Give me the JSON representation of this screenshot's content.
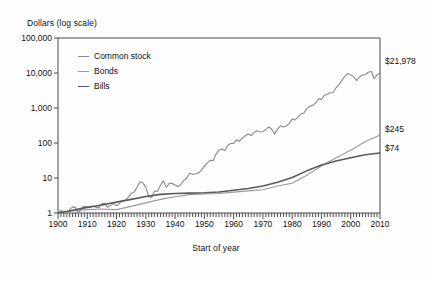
{
  "chart_data": {
    "type": "line",
    "title": "",
    "ylabel": "Dollars (log scale)",
    "xlabel": "Start of year",
    "scale": "log",
    "grid": false,
    "legend_position": "top-left",
    "xlim": [
      1900,
      2010
    ],
    "ylim": [
      1,
      100000
    ],
    "ytick_labels": [
      "100,000",
      "10,000",
      "1,000",
      "100",
      "10",
      "1"
    ],
    "ytick_values": [
      100000,
      10000,
      1000,
      100,
      10,
      1
    ],
    "xtick_labels": [
      "1900",
      "1910",
      "1920",
      "1930",
      "1940",
      "1950",
      "1960",
      "1970",
      "1980",
      "1990",
      "2000",
      "2010"
    ],
    "xtick_values": [
      1900,
      1910,
      1920,
      1930,
      1940,
      1950,
      1960,
      1970,
      1980,
      1990,
      2000,
      2010
    ],
    "minor_tick_interval": 1,
    "end_labels": [
      {
        "series": "Common stock",
        "text": "$21,978",
        "value": 21978
      },
      {
        "series": "Bonds",
        "text": "$245",
        "value": 245
      },
      {
        "series": "Bills",
        "text": "$74",
        "value": 74
      }
    ],
    "series": [
      {
        "name": "Common stock",
        "color": "#8a8a8a",
        "x": [
          1900,
          1901,
          1902,
          1903,
          1904,
          1905,
          1906,
          1907,
          1908,
          1909,
          1910,
          1911,
          1912,
          1913,
          1914,
          1915,
          1916,
          1917,
          1918,
          1919,
          1920,
          1921,
          1922,
          1923,
          1924,
          1925,
          1926,
          1927,
          1928,
          1929,
          1930,
          1931,
          1932,
          1933,
          1934,
          1935,
          1936,
          1937,
          1938,
          1939,
          1940,
          1941,
          1942,
          1943,
          1944,
          1945,
          1946,
          1947,
          1948,
          1949,
          1950,
          1951,
          1952,
          1953,
          1954,
          1955,
          1956,
          1957,
          1958,
          1959,
          1960,
          1961,
          1962,
          1963,
          1964,
          1965,
          1966,
          1967,
          1968,
          1969,
          1970,
          1971,
          1972,
          1973,
          1974,
          1975,
          1976,
          1977,
          1978,
          1979,
          1980,
          1981,
          1982,
          1983,
          1984,
          1985,
          1986,
          1987,
          1988,
          1989,
          1990,
          1991,
          1992,
          1993,
          1994,
          1995,
          1996,
          1997,
          1998,
          1999,
          2000,
          2001,
          2002,
          2003,
          2004,
          2005,
          2006,
          2007,
          2008,
          2009,
          2010
        ],
        "values": [
          1,
          1.18,
          1.08,
          0.94,
          1.25,
          1.5,
          1.45,
          0.95,
          1.4,
          1.55,
          1.45,
          1.5,
          1.56,
          1.46,
          1.42,
          1.85,
          1.9,
          1.45,
          1.65,
          1.85,
          1.62,
          1.85,
          2.3,
          2.28,
          2.85,
          3.6,
          3.95,
          5.4,
          7.8,
          7.2,
          5.4,
          3.0,
          2.75,
          4.25,
          4.2,
          6.2,
          8.3,
          5.4,
          7.0,
          7.0,
          6.3,
          5.6,
          6.7,
          8.4,
          10.0,
          13.7,
          12.6,
          13.3,
          14.0,
          16.6,
          21.9,
          27.0,
          32.0,
          31.6,
          48.2,
          63.4,
          67.5,
          60.3,
          86.5,
          96.8,
          97.3,
          123.5,
          112.7,
          138.3,
          161.2,
          181.3,
          163.0,
          201.8,
          224.0,
          205.1,
          213.3,
          243.7,
          290.0,
          247.4,
          181.8,
          249.6,
          309.4,
          287.3,
          306.2,
          362.6,
          480.3,
          456.9,
          555.3,
          680.8,
          723.6,
          953.3,
          1130,
          1189,
          1386,
          1825,
          1768,
          2308,
          2484,
          2734,
          2770,
          3812,
          4687,
          6250,
          8037,
          9727,
          8841,
          7792,
          6071,
          7813,
          8662,
          9086,
          10520,
          11098,
          6993,
          8840,
          10165
        ]
      },
      {
        "name": "Bonds",
        "color": "#9a9a9a",
        "x": [
          1900,
          1905,
          1910,
          1915,
          1920,
          1925,
          1930,
          1935,
          1940,
          1945,
          1950,
          1955,
          1960,
          1965,
          1970,
          1975,
          1980,
          1985,
          1990,
          1995,
          2000,
          2005,
          2010
        ],
        "values": [
          1,
          1.15,
          1.25,
          1.3,
          1.25,
          1.55,
          1.95,
          2.45,
          2.9,
          3.35,
          3.5,
          3.6,
          3.95,
          4.3,
          4.6,
          5.9,
          7.1,
          12.0,
          22.0,
          38.0,
          62.0,
          110.0,
          170.0
        ]
      },
      {
        "name": "Bills",
        "color": "#5a5a5a",
        "x": [
          1900,
          1905,
          1910,
          1915,
          1920,
          1925,
          1930,
          1935,
          1940,
          1945,
          1950,
          1955,
          1960,
          1965,
          1970,
          1975,
          1980,
          1985,
          1990,
          1995,
          2000,
          2005,
          2010
        ],
        "values": [
          1,
          1.2,
          1.45,
          1.7,
          2.05,
          2.45,
          2.95,
          3.4,
          3.6,
          3.7,
          3.8,
          4.0,
          4.45,
          5.0,
          5.9,
          7.6,
          10.4,
          16.0,
          23.5,
          30.5,
          38.0,
          46.0,
          52.0
        ]
      }
    ]
  },
  "legend": {
    "items": [
      {
        "label": "Common stock"
      },
      {
        "label": "Bonds"
      },
      {
        "label": "Bills"
      }
    ]
  }
}
